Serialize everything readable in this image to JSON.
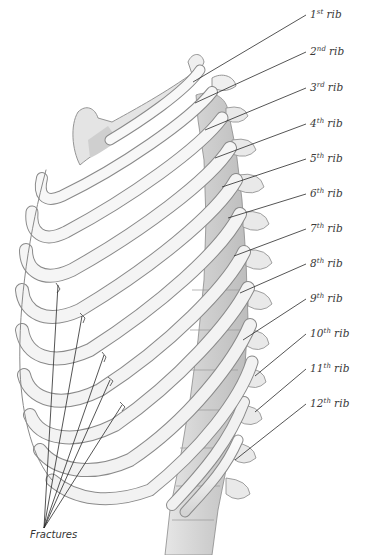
{
  "figure": {
    "colors": {
      "background": "#ffffff",
      "bone_fill": "#f3f3f3",
      "bone_shade": "#d8d8d8",
      "bone_outline": "#8a8a8a",
      "leader_line": "#2a2a2a",
      "label_text": "#3a3a3a"
    }
  },
  "rib_labels": [
    {
      "ordinal": "1",
      "suffix": "st",
      "word": "rib",
      "x": 310,
      "y": 15,
      "line_to": [
        193,
        82
      ]
    },
    {
      "ordinal": "2",
      "suffix": "nd",
      "word": "rib",
      "x": 310,
      "y": 52,
      "line_to": [
        195,
        103
      ]
    },
    {
      "ordinal": "3",
      "suffix": "rd",
      "word": "rib",
      "x": 310,
      "y": 88,
      "line_to": [
        205,
        130
      ]
    },
    {
      "ordinal": "4",
      "suffix": "th",
      "word": "rib",
      "x": 310,
      "y": 124,
      "line_to": [
        215,
        158
      ]
    },
    {
      "ordinal": "5",
      "suffix": "th",
      "word": "rib",
      "x": 310,
      "y": 159,
      "line_to": [
        222,
        187
      ]
    },
    {
      "ordinal": "6",
      "suffix": "th",
      "word": "rib",
      "x": 310,
      "y": 194,
      "line_to": [
        228,
        218
      ]
    },
    {
      "ordinal": "7",
      "suffix": "th",
      "word": "rib",
      "x": 310,
      "y": 229,
      "line_to": [
        234,
        256
      ]
    },
    {
      "ordinal": "8",
      "suffix": "th",
      "word": "rib",
      "x": 310,
      "y": 264,
      "line_to": [
        240,
        293
      ]
    },
    {
      "ordinal": "9",
      "suffix": "th",
      "word": "rib",
      "x": 310,
      "y": 299,
      "line_to": [
        243,
        340
      ]
    },
    {
      "ordinal": "10",
      "suffix": "th",
      "word": "rib",
      "x": 310,
      "y": 334,
      "line_to": [
        255,
        376
      ]
    },
    {
      "ordinal": "11",
      "suffix": "th",
      "word": "rib",
      "x": 310,
      "y": 369,
      "line_to": [
        255,
        412
      ]
    },
    {
      "ordinal": "12",
      "suffix": "th",
      "word": "rib",
      "x": 310,
      "y": 404,
      "line_to": [
        235,
        460
      ]
    }
  ],
  "fractures": {
    "label": "Fractures",
    "label_x": 30,
    "label_y": 535,
    "apex": [
      44,
      528
    ],
    "targets": [
      [
        58,
        285
      ],
      [
        82,
        316
      ],
      [
        104,
        355
      ],
      [
        110,
        380
      ],
      [
        122,
        405
      ]
    ]
  }
}
